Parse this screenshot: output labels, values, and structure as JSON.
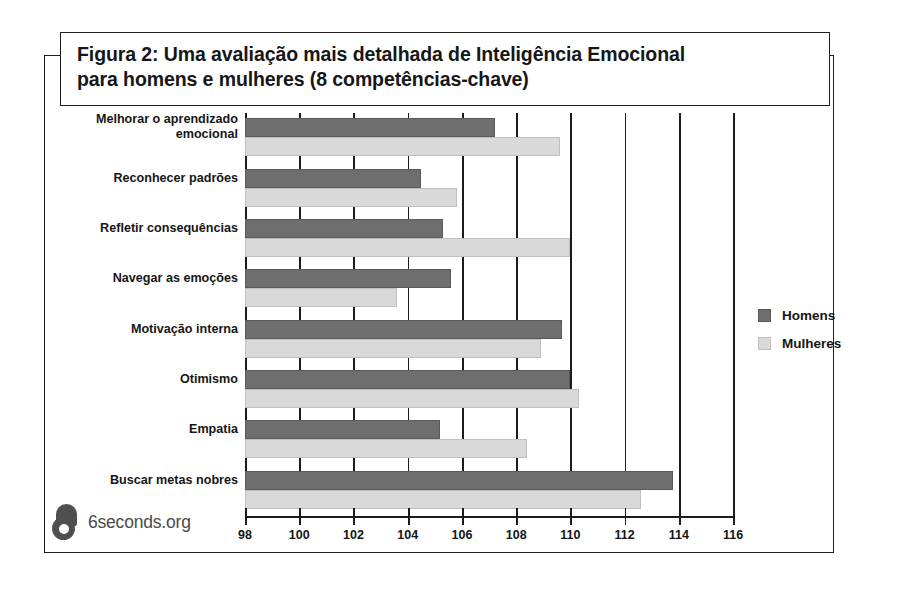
{
  "figure": {
    "title_line1": "Figura 2: Uma avaliação mais detalhada de Inteligência Emocional",
    "title_line2": "para homens e mulheres (8 competências-chave)"
  },
  "branding": {
    "logo_icon": "6seconds-logo-icon",
    "wordmark": "6seconds.org"
  },
  "legend": {
    "men_label": "Homens",
    "women_label": "Mulheres",
    "men_color": "#6e6e6e",
    "women_color": "#d9d9d9"
  },
  "axis": {
    "ticks": [
      "98",
      "100",
      "102",
      "104",
      "106",
      "108",
      "110",
      "112",
      "114",
      "116"
    ]
  },
  "categories": [
    "Melhorar o aprendizado\nemocional",
    "Reconhecer padrões",
    "Refletir consequências",
    "Navegar as emoções",
    "Motivação interna",
    "Otimismo",
    "Empatia",
    "Buscar metas nobres"
  ],
  "chart_data": {
    "type": "bar",
    "orientation": "horizontal",
    "title": "Figura 2: Uma avaliação mais detalhada de Inteligência Emocional para homens e mulheres (8 competências-chave)",
    "xlabel": "",
    "ylabel": "",
    "xlim": [
      98,
      116
    ],
    "xticks": [
      98,
      100,
      102,
      104,
      106,
      108,
      110,
      112,
      114,
      116
    ],
    "grid": true,
    "legend_position": "right",
    "categories": [
      "Melhorar o aprendizado emocional",
      "Reconhecer padrões",
      "Refletir consequências",
      "Navegar as emoções",
      "Motivação interna",
      "Otimismo",
      "Empatia",
      "Buscar metas nobres"
    ],
    "series": [
      {
        "name": "Homens",
        "color": "#6e6e6e",
        "values": [
          107.2,
          104.5,
          105.3,
          105.6,
          109.7,
          110.0,
          105.2,
          113.8
        ]
      },
      {
        "name": "Mulheres",
        "color": "#d9d9d9",
        "values": [
          109.6,
          105.8,
          110.0,
          103.6,
          108.9,
          110.3,
          108.4,
          112.6
        ]
      }
    ]
  }
}
